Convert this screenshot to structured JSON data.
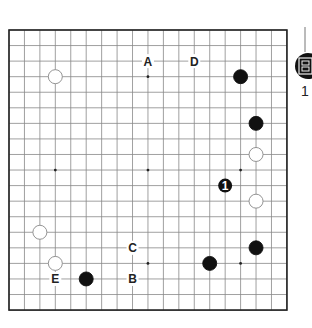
{
  "board": {
    "size": 19,
    "origin": {
      "x": 9,
      "y": 30
    },
    "spacing": {
      "x": 15.44,
      "y": 15.56
    },
    "line_color": "#888888",
    "border_color": "#222222"
  },
  "star_points": [
    [
      3,
      9
    ],
    [
      9,
      3
    ],
    [
      9,
      9
    ],
    [
      9,
      15
    ],
    [
      15,
      9
    ],
    [
      15,
      15
    ]
  ],
  "stones": [
    {
      "color": "white",
      "col": 3,
      "row": 3
    },
    {
      "color": "black",
      "col": 15,
      "row": 3
    },
    {
      "color": "black",
      "col": 16,
      "row": 6
    },
    {
      "color": "white",
      "col": 16,
      "row": 8
    },
    {
      "color": "white",
      "col": 16,
      "row": 11
    },
    {
      "color": "white",
      "col": 2,
      "row": 13
    },
    {
      "color": "black",
      "col": 16,
      "row": 14
    },
    {
      "color": "white",
      "col": 3,
      "row": 15
    },
    {
      "color": "black",
      "col": 13,
      "row": 15
    },
    {
      "color": "black",
      "col": 5,
      "row": 16
    }
  ],
  "move": {
    "color": "black",
    "col": 14,
    "row": 10,
    "number": "1"
  },
  "labels": [
    {
      "text": "A",
      "col": 9,
      "row": 2
    },
    {
      "text": "D",
      "col": 12,
      "row": 2
    },
    {
      "text": "C",
      "col": 8,
      "row": 14
    },
    {
      "text": "E",
      "col": 3,
      "row": 16
    },
    {
      "text": "B",
      "col": 8,
      "row": 16
    }
  ],
  "side_marker": {
    "icon": "black-stone-badge-icon",
    "number": "1"
  }
}
